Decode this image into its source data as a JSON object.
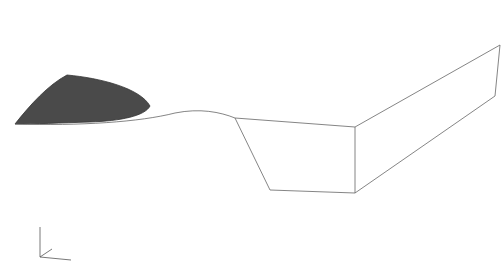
{
  "figure": {
    "colors": {
      "background": "#ffffff",
      "mesh_line": "#8a8a8a",
      "mesh_dash": "#6e6e6e",
      "shaded_region": "#4a4a4a",
      "edge": "#555555"
    }
  },
  "axes_triad": {
    "z_label": "Z",
    "y_label": "Y",
    "x_label": "X"
  }
}
